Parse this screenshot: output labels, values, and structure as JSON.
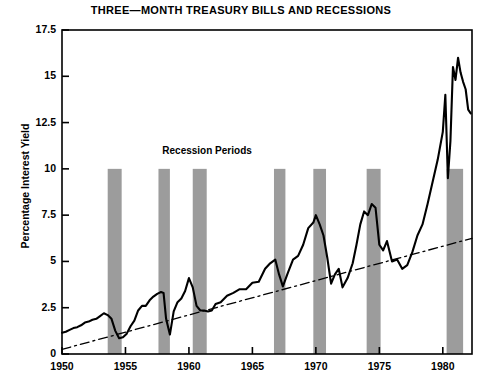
{
  "chart_data": {
    "type": "line",
    "title": "THREE—MONTH TREASURY BILLS AND RECESSIONS",
    "xlabel": "",
    "ylabel": "Percentage Interest Yield",
    "xlim": [
      1950,
      1982.3
    ],
    "ylim": [
      0,
      17.5
    ],
    "grid": false,
    "legend_position": "none",
    "xticks": [
      1950,
      1955,
      1960,
      1965,
      1970,
      1975,
      1980
    ],
    "xtick_labels": [
      "1950",
      "1955",
      "1960",
      "1965",
      "1970",
      "1975",
      "1980"
    ],
    "yticks": [
      0,
      2.5,
      5,
      7.5,
      10,
      12.5,
      15,
      17.5
    ],
    "ytick_labels": [
      "0",
      "2.5",
      "5",
      "7.5",
      "10",
      "12.5",
      "15",
      "17.5"
    ],
    "annotations": [
      {
        "text": "Recession Periods",
        "x": 1962.0,
        "y": 10.9
      }
    ],
    "series": [
      {
        "name": "Three-Month Treasury Bill Yield",
        "style": "solid",
        "color": "#000000",
        "x": [
          1950.0,
          1950.3,
          1950.6,
          1950.9,
          1951.2,
          1951.5,
          1951.8,
          1952.1,
          1952.4,
          1952.7,
          1953.0,
          1953.3,
          1953.6,
          1953.9,
          1954.2,
          1954.5,
          1954.8,
          1955.1,
          1955.4,
          1955.7,
          1956.0,
          1956.3,
          1956.6,
          1956.9,
          1957.2,
          1957.5,
          1957.8,
          1958.0,
          1958.2,
          1958.5,
          1958.8,
          1959.1,
          1959.4,
          1959.7,
          1960.0,
          1960.3,
          1960.6,
          1960.9,
          1961.2,
          1961.5,
          1961.8,
          1962.1,
          1962.5,
          1963.0,
          1963.5,
          1964.0,
          1964.5,
          1965.0,
          1965.5,
          1966.0,
          1966.4,
          1966.8,
          1967.1,
          1967.4,
          1967.8,
          1968.2,
          1968.6,
          1969.0,
          1969.4,
          1969.8,
          1970.0,
          1970.3,
          1970.6,
          1970.9,
          1971.2,
          1971.5,
          1971.8,
          1972.1,
          1972.5,
          1972.9,
          1973.2,
          1973.5,
          1973.8,
          1974.1,
          1974.4,
          1974.7,
          1975.0,
          1975.3,
          1975.6,
          1976.0,
          1976.4,
          1976.8,
          1977.2,
          1977.6,
          1978.0,
          1978.4,
          1978.8,
          1979.2,
          1979.6,
          1980.0,
          1980.2,
          1980.4,
          1980.6,
          1980.8,
          1981.0,
          1981.2,
          1981.4,
          1981.6,
          1981.8,
          1982.0,
          1982.2
        ],
        "y": [
          1.15,
          1.2,
          1.3,
          1.4,
          1.45,
          1.55,
          1.7,
          1.75,
          1.85,
          1.9,
          2.05,
          2.2,
          2.1,
          1.9,
          1.25,
          0.85,
          0.9,
          1.1,
          1.5,
          1.8,
          2.35,
          2.6,
          2.6,
          2.9,
          3.1,
          3.25,
          3.35,
          3.3,
          1.9,
          1.05,
          2.3,
          2.8,
          3.0,
          3.4,
          4.1,
          3.6,
          2.6,
          2.35,
          2.35,
          2.3,
          2.35,
          2.7,
          2.8,
          3.15,
          3.3,
          3.5,
          3.5,
          3.85,
          3.9,
          4.6,
          4.9,
          5.1,
          4.3,
          3.65,
          4.4,
          5.1,
          5.3,
          5.9,
          6.8,
          7.1,
          7.5,
          7.0,
          6.4,
          5.2,
          3.8,
          4.3,
          4.6,
          3.6,
          4.1,
          4.9,
          5.9,
          7.0,
          7.7,
          7.5,
          8.1,
          7.9,
          5.9,
          5.6,
          6.1,
          5.0,
          5.1,
          4.6,
          4.8,
          5.5,
          6.4,
          7.0,
          8.1,
          9.3,
          10.5,
          12.0,
          14.0,
          9.5,
          11.5,
          15.5,
          14.8,
          16.0,
          15.2,
          14.7,
          14.3,
          13.2,
          13.0
        ]
      },
      {
        "name": "Trend Line",
        "style": "dashdot",
        "color": "#000000",
        "x": [
          1950.0,
          1982.3
        ],
        "y": [
          0.25,
          6.25
        ]
      }
    ],
    "recession_bands": [
      {
        "start": 1953.6,
        "end": 1954.7,
        "label": "1953-54"
      },
      {
        "start": 1957.6,
        "end": 1958.5,
        "label": "1957-58"
      },
      {
        "start": 1960.3,
        "end": 1961.4,
        "label": "1960-61"
      },
      {
        "start": 1966.7,
        "end": 1967.6,
        "label": "1966-67"
      },
      {
        "start": 1969.8,
        "end": 1970.8,
        "label": "1969-70"
      },
      {
        "start": 1974.0,
        "end": 1975.1,
        "label": "1974-75"
      },
      {
        "start": 1980.3,
        "end": 1981.6,
        "label": "1980-81"
      }
    ],
    "recession_band_color": "#9c9c9c",
    "recession_band_top_value": 10
  }
}
